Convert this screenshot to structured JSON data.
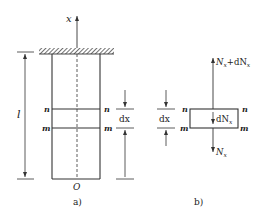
{
  "figure_a": {
    "caption": "a)",
    "axis_label": "x",
    "origin_label": "O",
    "length_label": "l",
    "section_n_left": "n",
    "section_n_right": "n",
    "section_m_left": "m",
    "section_m_right": "m",
    "dx_label": "dx"
  },
  "figure_b": {
    "caption": "b)",
    "top_force": "N",
    "top_force_sub": "x",
    "top_force_plus": "+dN",
    "top_force_plus_sub": "x",
    "inner_force": "dN",
    "inner_force_sub": "x",
    "bottom_force": "N",
    "bottom_force_sub": "x",
    "section_n_left": "n",
    "section_n_right": "n",
    "section_m_left": "m",
    "section_m_right": "m",
    "dx_label": "dx"
  },
  "colors": {
    "line": "#333333",
    "background": "#ffffff"
  }
}
